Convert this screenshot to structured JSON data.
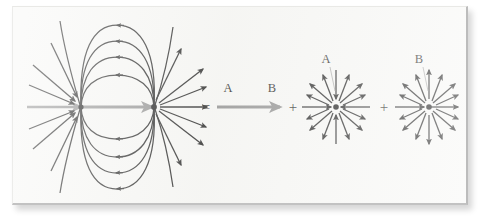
{
  "figure": {
    "title_visible": false,
    "labels": {
      "equals": "=",
      "plus_1": "+",
      "plus_2": "+",
      "a_equation": "A",
      "b_equation": "B",
      "a_starburst": "A",
      "b_starburst": "B"
    },
    "colors": {
      "background": "#ffffff",
      "panel": "#f7f7f5",
      "field_line": "#1a1a1a",
      "axis_arrow": "#8c8c8c",
      "equation_arrow": "#8c8c8c",
      "label_text": "#1a1a1a",
      "leader_line": "#8d8d8d",
      "panel_border": "#bcbcbc"
    },
    "panels": [
      {
        "name": "dipole-field",
        "type": "dipole",
        "sink_label": "A",
        "source_label": "B",
        "sink_point": [
          68,
          100
        ],
        "source_point": [
          141,
          100
        ],
        "loop_count": 4,
        "radial_ray_count": 8
      },
      {
        "name": "uniform-arrow",
        "type": "uniform",
        "start_label": "A",
        "end_label": "B",
        "direction": "left-to-right"
      },
      {
        "name": "radial-field-a",
        "type": "radial",
        "label": "A",
        "ray_count": 12,
        "arrow_direction": "mixed-radial"
      },
      {
        "name": "radial-field-b",
        "type": "radial",
        "label": "B",
        "ray_count": 12,
        "arrow_direction": "mixed-radial"
      }
    ]
  }
}
